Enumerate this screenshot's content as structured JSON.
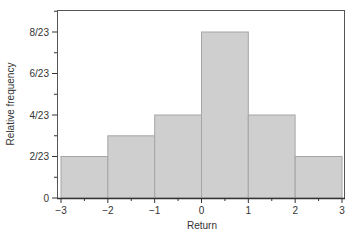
{
  "chart_data": {
    "type": "bar",
    "subtype": "histogram",
    "title": "",
    "xlabel": "Return",
    "ylabel": "Relative frequency",
    "bins": [
      {
        "from": -3,
        "to": -2,
        "value": 2
      },
      {
        "from": -2,
        "to": -1,
        "value": 3
      },
      {
        "from": -1,
        "to": 0,
        "value": 4
      },
      {
        "from": 0,
        "to": 1,
        "value": 8
      },
      {
        "from": 1,
        "to": 2,
        "value": 4
      },
      {
        "from": 2,
        "to": 3,
        "value": 2
      }
    ],
    "categories": [
      "-3 to -2",
      "-2 to -1",
      "-1 to 0",
      "0 to 1",
      "1 to 2",
      "2 to 3"
    ],
    "values": [
      0.087,
      0.13,
      0.174,
      0.348,
      0.174,
      0.087
    ],
    "values_fraction": [
      "2/23",
      "3/23",
      "4/23",
      "8/23",
      "4/23",
      "2/23"
    ],
    "denominator": 23,
    "xlim": [
      -3,
      3
    ],
    "ylim": [
      0,
      0.39
    ],
    "xticks": [
      "-3",
      "-2",
      "-1",
      "0",
      "1",
      "2",
      "3"
    ],
    "yticks": [
      "0",
      "2/23",
      "4/23",
      "6/23",
      "8/23"
    ],
    "grid": false,
    "legend": null,
    "colors": {
      "bar_fill": "#cfcfcf",
      "bar_stroke": "#a6a6a6",
      "axis": "#333333"
    }
  }
}
